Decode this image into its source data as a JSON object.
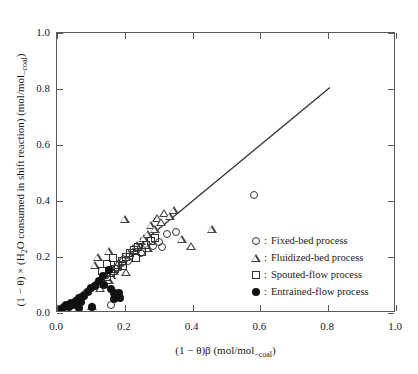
{
  "chart_data": {
    "type": "scatter",
    "title": "",
    "xlabel": "(1 − θ)β (mol/mol_coal)",
    "ylabel": "(1 − θ) × (H₂O consumed in shift reaction) (mol/mol_coal)",
    "xlim": [
      0.0,
      1.0
    ],
    "ylim": [
      0.0,
      1.0
    ],
    "xticks": [
      "0.0",
      "0.2",
      "0.4",
      "0.6",
      "0.8",
      "1.0"
    ],
    "yticks": [
      "0.0",
      "0.2",
      "0.4",
      "0.6",
      "0.8",
      "1.0"
    ],
    "xtick_values": [
      0.0,
      0.2,
      0.4,
      0.6,
      0.8,
      1.0
    ],
    "ytick_values": [
      0.0,
      0.2,
      0.4,
      0.6,
      0.8,
      1.0
    ],
    "grid": false,
    "legend_position": "right-middle",
    "reference_line": {
      "name": "parity-line",
      "x": [
        0.0,
        0.805
      ],
      "y": [
        0.0,
        0.805
      ],
      "style": "solid",
      "color": "#333333"
    },
    "series": [
      {
        "name": "Fixed-bed process",
        "marker": "circle-open",
        "points": [
          [
            0.178,
            0.16
          ],
          [
            0.193,
            0.178
          ],
          [
            0.208,
            0.186
          ],
          [
            0.215,
            0.205
          ],
          [
            0.232,
            0.222
          ],
          [
            0.247,
            0.213
          ],
          [
            0.262,
            0.247
          ],
          [
            0.283,
            0.238
          ],
          [
            0.3,
            0.255
          ],
          [
            0.31,
            0.236
          ],
          [
            0.325,
            0.281
          ],
          [
            0.352,
            0.288
          ],
          [
            0.16,
            0.03
          ],
          [
            0.58,
            0.42
          ]
        ]
      },
      {
        "name": "Fluidized-bed process",
        "marker": "triangle-open",
        "points": [
          [
            0.128,
            0.088
          ],
          [
            0.14,
            0.102
          ],
          [
            0.152,
            0.118
          ],
          [
            0.16,
            0.134
          ],
          [
            0.168,
            0.15
          ],
          [
            0.176,
            0.166
          ],
          [
            0.184,
            0.182
          ],
          [
            0.196,
            0.198
          ],
          [
            0.204,
            0.148
          ],
          [
            0.212,
            0.213
          ],
          [
            0.224,
            0.232
          ],
          [
            0.236,
            0.244
          ],
          [
            0.248,
            0.258
          ],
          [
            0.256,
            0.268
          ],
          [
            0.268,
            0.282
          ],
          [
            0.276,
            0.316
          ],
          [
            0.288,
            0.3
          ],
          [
            0.296,
            0.338
          ],
          [
            0.308,
            0.325
          ],
          [
            0.316,
            0.356
          ],
          [
            0.332,
            0.346
          ],
          [
            0.344,
            0.368
          ],
          [
            0.2,
            0.336
          ],
          [
            0.268,
            0.232
          ],
          [
            0.152,
            0.22
          ],
          [
            0.12,
            0.2
          ],
          [
            0.112,
            0.172
          ],
          [
            0.104,
            0.024
          ],
          [
            0.456,
            0.3
          ],
          [
            0.396,
            0.238
          ],
          [
            0.368,
            0.264
          ]
        ]
      },
      {
        "name": "Spouted-flow process",
        "marker": "square-open",
        "points": [
          [
            0.148,
            0.128
          ],
          [
            0.16,
            0.142
          ],
          [
            0.172,
            0.158
          ],
          [
            0.18,
            0.172
          ],
          [
            0.192,
            0.186
          ],
          [
            0.204,
            0.2
          ],
          [
            0.216,
            0.214
          ],
          [
            0.228,
            0.224
          ],
          [
            0.24,
            0.236
          ],
          [
            0.252,
            0.218
          ],
          [
            0.264,
            0.244
          ],
          [
            0.276,
            0.256
          ],
          [
            0.288,
            0.268
          ],
          [
            0.148,
            0.176
          ],
          [
            0.164,
            0.196
          ],
          [
            0.132,
            0.15
          ],
          [
            0.232,
            0.196
          ],
          [
            0.196,
            0.168
          ]
        ]
      },
      {
        "name": "Entrained-flow process",
        "marker": "circle-filled",
        "points": [
          [
            0.012,
            0.014
          ],
          [
            0.02,
            0.022
          ],
          [
            0.028,
            0.03
          ],
          [
            0.034,
            0.02
          ],
          [
            0.042,
            0.036
          ],
          [
            0.048,
            0.028
          ],
          [
            0.056,
            0.044
          ],
          [
            0.064,
            0.052
          ],
          [
            0.07,
            0.038
          ],
          [
            0.08,
            0.062
          ],
          [
            0.092,
            0.074
          ],
          [
            0.1,
            0.088
          ],
          [
            0.112,
            0.098
          ],
          [
            0.124,
            0.116
          ],
          [
            0.136,
            0.132
          ],
          [
            0.152,
            0.152
          ],
          [
            0.16,
            0.084
          ],
          [
            0.168,
            0.07
          ],
          [
            0.184,
            0.072
          ],
          [
            0.168,
            0.05
          ],
          [
            0.186,
            0.052
          ],
          [
            0.064,
            0.018
          ],
          [
            0.104,
            0.022
          ],
          [
            0.14,
            0.1
          ]
        ]
      }
    ]
  },
  "legend": {
    "items": [
      {
        "label": "Fixed-bed process",
        "marker": "circle-open"
      },
      {
        "label": "Fluidized-bed process",
        "marker": "triangle-open"
      },
      {
        "label": "Spouted-flow process",
        "marker": "square-open"
      },
      {
        "label": "Entrained-flow process",
        "marker": "circle-filled"
      }
    ],
    "separator": ":"
  }
}
